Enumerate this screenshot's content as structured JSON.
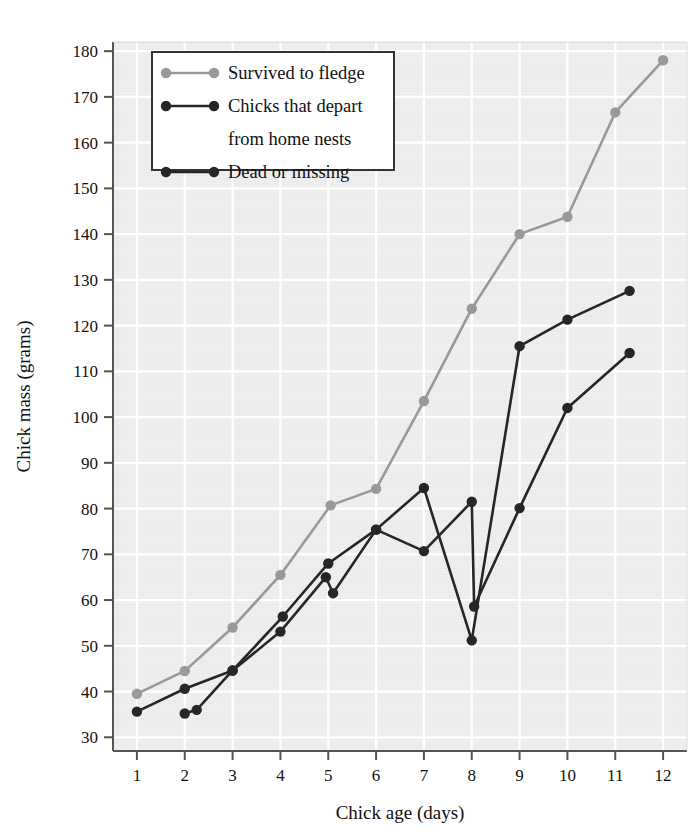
{
  "chart_data": {
    "type": "line",
    "title": "",
    "xlabel": "Chick age (days)",
    "ylabel": "Chick mass (grams)",
    "xlim": [
      0.5,
      12.5
    ],
    "ylim": [
      27,
      182
    ],
    "xticks": [
      1,
      2,
      3,
      4,
      5,
      6,
      7,
      8,
      9,
      10,
      11,
      12
    ],
    "yticks": [
      30,
      40,
      50,
      60,
      70,
      80,
      90,
      100,
      110,
      120,
      130,
      140,
      150,
      160,
      170,
      180
    ],
    "grid": true,
    "legend_position": "top-left",
    "plot_bg": "#ebebeb",
    "grid_color": "#ffffff",
    "series": [
      {
        "name": "Survived to fledge",
        "color": "#999999",
        "marker": "circle",
        "points": [
          {
            "x": 1.0,
            "y": 39.5
          },
          {
            "x": 2.0,
            "y": 44.5
          },
          {
            "x": 3.0,
            "y": 54.0
          },
          {
            "x": 4.0,
            "y": 65.5
          },
          {
            "x": 5.05,
            "y": 80.7
          },
          {
            "x": 6.0,
            "y": 84.3
          },
          {
            "x": 7.0,
            "y": 103.5
          },
          {
            "x": 8.0,
            "y": 123.7
          },
          {
            "x": 9.0,
            "y": 140.0
          },
          {
            "x": 10.0,
            "y": 143.8
          },
          {
            "x": 11.0,
            "y": 166.6
          },
          {
            "x": 12.0,
            "y": 178.0
          }
        ]
      },
      {
        "name": "Chicks that depart from home nests",
        "color": "#262626",
        "marker": "circle",
        "points": [
          {
            "x": 1.0,
            "y": 35.6
          },
          {
            "x": 2.0,
            "y": 40.6
          },
          {
            "x": 3.0,
            "y": 44.6
          },
          {
            "x": 4.05,
            "y": 56.4
          },
          {
            "x": 5.0,
            "y": 68.0
          },
          {
            "x": 6.0,
            "y": 75.4
          },
          {
            "x": 7.0,
            "y": 84.5
          },
          {
            "x": 8.0,
            "y": 51.2
          },
          {
            "x": 9.0,
            "y": 115.5
          },
          {
            "x": 10.0,
            "y": 121.3
          },
          {
            "x": 11.3,
            "y": 127.6
          }
        ]
      },
      {
        "name": "Dead or missing",
        "color": "#262626",
        "marker": "circle",
        "points": [
          {
            "x": 2.0,
            "y": 35.2
          },
          {
            "x": 2.25,
            "y": 36.0
          },
          {
            "x": 3.0,
            "y": 44.6
          },
          {
            "x": 4.0,
            "y": 53.1
          },
          {
            "x": 4.95,
            "y": 65.0
          },
          {
            "x": 5.1,
            "y": 61.5
          },
          {
            "x": 6.0,
            "y": 75.4
          },
          {
            "x": 7.0,
            "y": 70.7
          },
          {
            "x": 8.0,
            "y": 81.5
          },
          {
            "x": 8.05,
            "y": 58.6
          },
          {
            "x": 9.0,
            "y": 80.1
          },
          {
            "x": 10.0,
            "y": 102.0
          },
          {
            "x": 11.3,
            "y": 114.0
          }
        ]
      }
    ]
  },
  "legend": {
    "entries": [
      {
        "label": "Survived to fledge",
        "color": "#999999"
      },
      {
        "label": "Chicks that depart",
        "color": "#262626"
      },
      {
        "label": "from home nests",
        "color": null
      },
      {
        "label": "Dead or missing",
        "color": "#262626"
      }
    ]
  }
}
